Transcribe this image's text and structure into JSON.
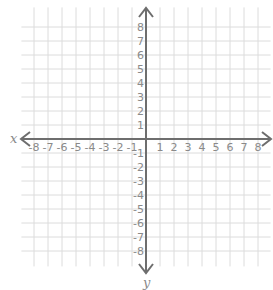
{
  "chart_data": {
    "type": "coordinate-plane",
    "title": "",
    "xlabel": "x",
    "ylabel": "y",
    "xlim": [
      -8,
      8
    ],
    "ylim": [
      -8,
      8
    ],
    "grid": true,
    "x_ticks": [
      -8,
      -7,
      -6,
      -5,
      -4,
      -3,
      -2,
      -1,
      1,
      2,
      3,
      4,
      5,
      6,
      7,
      8
    ],
    "y_ticks": [
      8,
      7,
      6,
      5,
      4,
      3,
      2,
      1,
      -1,
      -2,
      -3,
      -4,
      -5,
      -6,
      -7,
      -8
    ],
    "arrows": "both-ends",
    "points": [],
    "legend": null
  },
  "layout": {
    "origin": [
      146,
      139
    ],
    "unit": 14,
    "grid_extent": {
      "xmin": -8.9,
      "xmax": 8.9,
      "ymin": -9.1,
      "ymax": 9.4
    },
    "colors": {
      "grid": "#dcdcdc",
      "axis": "#6e6e6e",
      "label": "#8a8a8a"
    }
  }
}
